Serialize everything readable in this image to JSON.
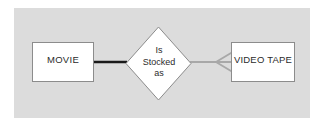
{
  "diagram": {
    "type": "entity-relationship-diagram",
    "notation": "chen-with-crowsfoot",
    "canvas": {
      "background_color": "#dcdcdc",
      "page_color": "#ffffff"
    },
    "entities": [
      {
        "id": "movie",
        "label": "MOVIE",
        "shape": "rectangle",
        "fill_color": "#ffffff",
        "border_color": "#8c8c8c"
      },
      {
        "id": "video-tape",
        "label": "VIDEO TAPE",
        "shape": "rectangle",
        "fill_color": "#ffffff",
        "border_color": "#8c8c8c"
      }
    ],
    "relationship": {
      "id": "is-stocked-as",
      "shape": "diamond",
      "fill_color": "#ffffff",
      "border_color": "#8c8c8c",
      "label_lines": [
        "Is",
        "Stocked",
        "as"
      ]
    },
    "connectors": [
      {
        "id": "movie-to-relationship",
        "from": "movie",
        "to": "is-stocked-as",
        "style": "solid",
        "color": "#1a1a1a",
        "thickness": 2.6,
        "end_marker": "none"
      },
      {
        "id": "relationship-to-video-tape",
        "from": "is-stocked-as",
        "to": "video-tape",
        "style": "solid",
        "color": "#a8a8a8",
        "thickness": 2.2,
        "end_marker": "crows-foot"
      }
    ]
  }
}
